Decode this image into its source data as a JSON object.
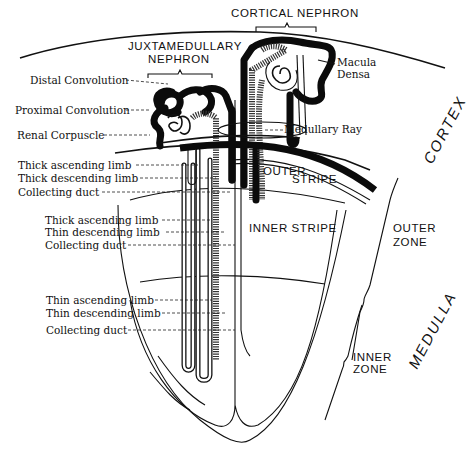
{
  "figure": {
    "type": "anatomical-diagram"
  },
  "headers": {
    "cortical_nephron": "CORTICAL NEPHRON",
    "juxtamedullary_line1": "JUXTAMEDULLARY",
    "juxtamedullary_line2": "NEPHRON"
  },
  "left_labels": {
    "distal_convolution": "Distal Convolution",
    "proximal_convolution": "Proximal Convolution",
    "renal_corpuscle": "Renal Corpuscle",
    "outer_stripe_group": [
      "Thick ascending limb",
      "Thick descending limb",
      "Collecting duct"
    ],
    "inner_stripe_group": [
      "Thick ascending limb",
      "Thin descending limb",
      "Collecting duct"
    ],
    "inner_zone_group": [
      "Thin ascending limb",
      "Thin descending limb",
      "Collecting duct"
    ]
  },
  "right_labels": {
    "macula_densa_line1": "Macula",
    "macula_densa_line2": "Densa",
    "medullary_ray": "Medullary Ray"
  },
  "regions": {
    "outer_stripe_line1": "OUTER",
    "outer_stripe_line2": "STRIPE",
    "inner_stripe": "INNER STRIPE",
    "outer_zone_line1": "OUTER",
    "outer_zone_line2": "ZONE",
    "inner_zone_line1": "INNER",
    "inner_zone_line2": "ZONE",
    "cortex": "CORTEX",
    "medulla": "MEDULLA"
  }
}
